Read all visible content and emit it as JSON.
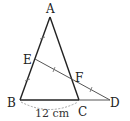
{
  "figure": {
    "points": {
      "A": "A",
      "B": "B",
      "C": "C",
      "D": "D",
      "E": "E",
      "F": "F"
    },
    "dimension_label": "12 cm",
    "segments": [
      "AB",
      "AC",
      "BC",
      "CD",
      "ED"
    ],
    "tick_marks": {
      "AE_BE": "single tick (AE = EB)",
      "EF_FD": "single tick (EF = FD)"
    },
    "colors": {
      "stroke": "#222222",
      "dimension_arc": "#999999"
    }
  }
}
